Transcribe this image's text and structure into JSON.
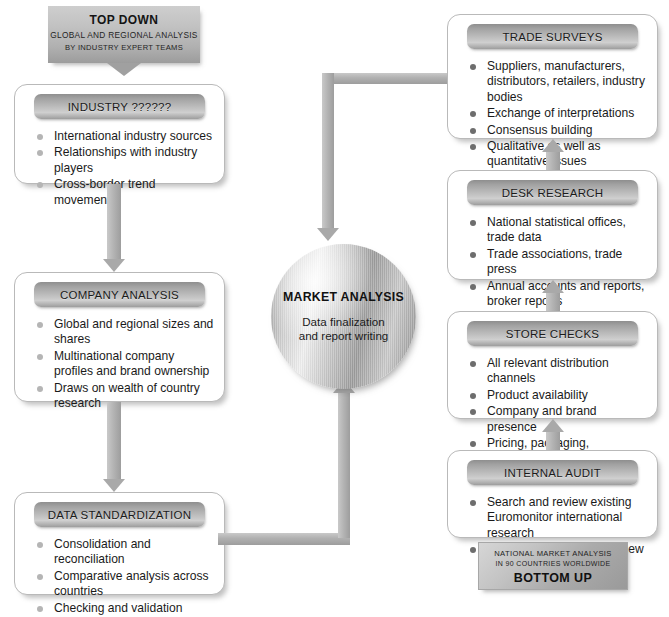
{
  "diagram": {
    "top_down_banner": {
      "line1": "TOP DOWN",
      "line2": "GLOBAL AND REGIONAL ANALYSIS",
      "line3": "BY INDUSTRY EXPERT TEAMS"
    },
    "bottom_up_banner": {
      "line1": "NATIONAL MARKET ANALYSIS",
      "line2": "IN 90 COUNTRIES WORLDWIDE",
      "line3": "BOTTOM UP"
    },
    "center": {
      "title": "MARKET ANALYSIS",
      "subtitle": "Data finalization\nand report writing",
      "subtitle_line1": "Data finalization",
      "subtitle_line2": "and report writing"
    },
    "left_column": [
      {
        "header": "INDUSTRY ??????",
        "bullets": [
          "International industry sources",
          "Relationships with industry players",
          "Cross-border trend movements"
        ]
      },
      {
        "header": "COMPANY ANALYSIS",
        "bullets": [
          "Global and regional sizes and shares",
          "Multinational company profiles and brand ownership",
          "Draws on wealth of country research"
        ]
      },
      {
        "header": "DATA STANDARDIZATION",
        "bullets": [
          "Consolidation and reconciliation",
          "Comparative analysis across countries",
          "Checking and validation"
        ]
      }
    ],
    "right_column": [
      {
        "header": "TRADE SURVEYS",
        "bullets": [
          "Suppliers, manufacturers, distributors, retailers, industry bodies",
          "Exchange of interpretations",
          "Consensus building",
          "Qualitative as well as quantitative issues"
        ]
      },
      {
        "header": "DESK RESEARCH",
        "bullets": [
          "National statistical offices, trade data",
          "Trade associations, trade press",
          "Annual accounts and reports, broker reports",
          "Business and financial press"
        ]
      },
      {
        "header": "STORE CHECKS",
        "bullets": [
          "All relevant distribution channels",
          "Product availability",
          "Company and brand presence",
          "Pricing, packaging, promotions"
        ]
      },
      {
        "header": "INTERNAL AUDIT",
        "bullets": [
          "Search and review existing Euromonitor international research",
          "Context and contacts for new annual update project"
        ]
      }
    ],
    "colors": {
      "header_bar_dark": "#8e8e8e",
      "header_bar_light": "#cfcfcf",
      "connector": "#b0b0b0",
      "bullet_light": "#b5b5b5",
      "bullet_dark": "#6d6d6d",
      "panel_border": "#b9b9b9",
      "text": "#1a1a1a",
      "background": "#ffffff"
    }
  }
}
